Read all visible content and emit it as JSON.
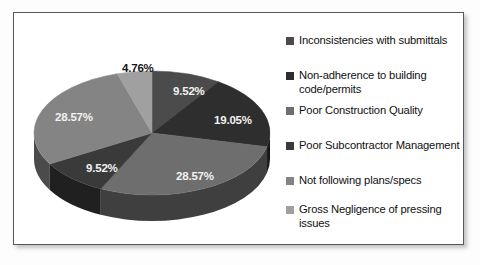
{
  "figure": {
    "background": "#fdfdfd",
    "panel_background": "#ffffff",
    "border_color": "#55585c"
  },
  "chart_data": {
    "type": "pie",
    "title": "",
    "subtitle": "",
    "xlabel": "",
    "ylabel": "",
    "grid": false,
    "legend_position": "right",
    "three_d": true,
    "start_angle_deg": 0,
    "direction": "clockwise",
    "categories": [
      "Inconsistencies with submittals",
      "Non-adherence to building code/permits",
      "Poor Construction Quality",
      "Poor Subcontractor Management",
      "Not following plans/specs",
      "Gross Negligence of pressing issues"
    ],
    "values": [
      9.52,
      19.05,
      28.57,
      9.52,
      28.57,
      4.76
    ],
    "value_labels": [
      "9.52%",
      "19.05%",
      "28.57%",
      "9.52%",
      "28.57%",
      "4.76%"
    ],
    "colors": [
      "#4b4b4b",
      "#2e2e2e",
      "#6e6e6e",
      "#3a3a3a",
      "#848484",
      "#a0a0a0"
    ],
    "units": "percent",
    "total": 100
  },
  "slices": [
    {
      "label": "9.52%",
      "value": 9.52,
      "color": "#4b4b4b",
      "side_color": "#2a2a2a",
      "label_x": 145,
      "label_y": 56,
      "label_style": "on-dark"
    },
    {
      "label": "19.05%",
      "value": 19.05,
      "color": "#2e2e2e",
      "side_color": "#181818",
      "label_x": 186,
      "label_y": 85,
      "label_style": "on-dark"
    },
    {
      "label": "28.57%",
      "value": 28.57,
      "color": "#6e6e6e",
      "side_color": "#3f3f3f",
      "label_x": 148,
      "label_y": 141,
      "label_style": "on-dark"
    },
    {
      "label": "9.52%",
      "value": 9.52,
      "color": "#3a3a3a",
      "side_color": "#202020",
      "label_x": 58,
      "label_y": 133,
      "label_style": "on-dark"
    },
    {
      "label": "28.57%",
      "value": 28.57,
      "color": "#848484",
      "side_color": "#4b4b4b",
      "label_x": 27,
      "label_y": 82,
      "label_style": "on-dark"
    },
    {
      "label": "4.76%",
      "value": 4.76,
      "color": "#a0a0a0",
      "side_color": "#5a5a5a",
      "label_x": 94,
      "label_y": 33,
      "label_style": "outside"
    }
  ],
  "legend": {
    "items": [
      {
        "label": "Inconsistencies with submittals",
        "color": "#4b4b4b",
        "top": 7
      },
      {
        "label": "Non-adherence to building code/permits",
        "color": "#2e2e2e",
        "top": 42
      },
      {
        "label": "Poor Construction Quality",
        "color": "#6e6e6e",
        "top": 77
      },
      {
        "label": "Poor Subcontractor Management",
        "color": "#3a3a3a",
        "top": 112
      },
      {
        "label": "Not following plans/specs",
        "color": "#848484",
        "top": 147
      },
      {
        "label": "Gross Negligence of pressing issues",
        "color": "#a0a0a0",
        "top": 176
      }
    ]
  }
}
